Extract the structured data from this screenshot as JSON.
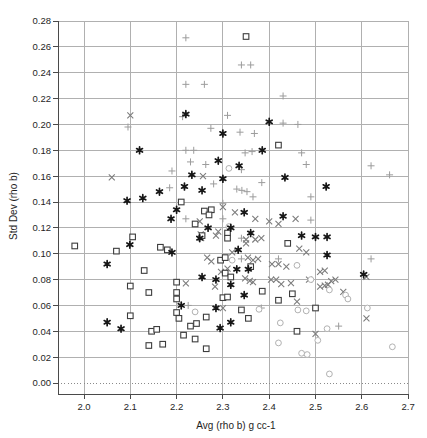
{
  "chart_data": {
    "type": "scatter",
    "title": "",
    "xlabel": "Avg (rho b) g cc-1",
    "ylabel": "Std Dev (rho b)",
    "xlim": [
      1.94,
      2.72
    ],
    "ylim": [
      -0.009,
      0.28
    ],
    "grid": true,
    "zero_line_style": "dotted",
    "legend": "none",
    "x_tick_labels": [
      "2.0",
      "2.1",
      "2.2",
      "2.3",
      "2.4",
      "2.5",
      "2.6",
      "2.7"
    ],
    "y_tick_labels": [
      "0.00",
      "0.02",
      "0.04",
      "0.06",
      "0.08",
      "0.10",
      "0.12",
      "0.14",
      "0.16",
      "0.18",
      "0.20",
      "0.22",
      "0.24",
      "0.26",
      "0.28"
    ],
    "colors": {
      "background": "#ffffff",
      "grid": "#b0b0b0",
      "axis": "#4a4a4a",
      "zero_line": "#8a8a8a"
    },
    "series": [
      {
        "name": "plus-markers",
        "marker": "plus",
        "color": "#9c9c9c",
        "points": [
          [
            2.22,
            0.267
          ],
          [
            2.22,
            0.231
          ],
          [
            2.26,
            0.231
          ],
          [
            2.34,
            0.246
          ],
          [
            2.36,
            0.246
          ],
          [
            2.43,
            0.222
          ],
          [
            2.31,
            0.207
          ],
          [
            2.213,
            0.206
          ],
          [
            2.095,
            0.198
          ],
          [
            2.274,
            0.197
          ],
          [
            2.337,
            0.194
          ],
          [
            2.368,
            0.193
          ],
          [
            2.43,
            0.201
          ],
          [
            2.462,
            0.2
          ],
          [
            2.22,
            0.18
          ],
          [
            2.237,
            0.18
          ],
          [
            2.348,
            0.178
          ],
          [
            2.363,
            0.179
          ],
          [
            2.47,
            0.178
          ],
          [
            2.23,
            0.171
          ],
          [
            2.19,
            0.164
          ],
          [
            2.34,
            0.165
          ],
          [
            2.48,
            0.169
          ],
          [
            2.62,
            0.168
          ],
          [
            2.66,
            0.161
          ],
          [
            2.263,
            0.169
          ],
          [
            2.185,
            0.151
          ],
          [
            2.28,
            0.154
          ],
          [
            2.384,
            0.155
          ],
          [
            2.33,
            0.15
          ],
          [
            2.341,
            0.149
          ],
          [
            2.352,
            0.148
          ],
          [
            2.365,
            0.144
          ],
          [
            2.3,
            0.139
          ],
          [
            2.22,
            0.127
          ],
          [
            2.3,
            0.127
          ],
          [
            2.49,
            0.144
          ],
          [
            2.49,
            0.126
          ],
          [
            2.34,
            0.112
          ],
          [
            2.42,
            0.096
          ],
          [
            2.34,
            0.096
          ],
          [
            2.62,
            0.096
          ],
          [
            2.383,
            0.058
          ],
          [
            2.225,
            0.06
          ],
          [
            2.55,
            0.044
          ]
        ]
      },
      {
        "name": "x-markers",
        "marker": "x",
        "color": "#7d7d7d",
        "points": [
          [
            2.1,
            0.207
          ],
          [
            2.06,
            0.159
          ],
          [
            2.257,
            0.16
          ],
          [
            2.3,
            0.136
          ],
          [
            2.326,
            0.132
          ],
          [
            2.37,
            0.127
          ],
          [
            2.4,
            0.125
          ],
          [
            2.25,
            0.125
          ],
          [
            2.457,
            0.127
          ],
          [
            2.42,
            0.123
          ],
          [
            2.29,
            0.117
          ],
          [
            2.285,
            0.114
          ],
          [
            2.252,
            0.115
          ],
          [
            2.35,
            0.111
          ],
          [
            2.37,
            0.111
          ],
          [
            2.383,
            0.112
          ],
          [
            2.253,
            0.112
          ],
          [
            2.32,
            0.101
          ],
          [
            2.35,
            0.108
          ],
          [
            2.48,
            0.101
          ],
          [
            2.465,
            0.104
          ],
          [
            2.266,
            0.097
          ],
          [
            2.275,
            0.094
          ],
          [
            2.354,
            0.097
          ],
          [
            2.365,
            0.095
          ],
          [
            2.376,
            0.096
          ],
          [
            2.406,
            0.092
          ],
          [
            2.42,
            0.092
          ],
          [
            2.437,
            0.09
          ],
          [
            2.296,
            0.086
          ],
          [
            2.31,
            0.0885
          ],
          [
            2.348,
            0.081
          ],
          [
            2.358,
            0.079
          ],
          [
            2.365,
            0.078
          ],
          [
            2.404,
            0.08
          ],
          [
            2.415,
            0.08
          ],
          [
            2.426,
            0.0765
          ],
          [
            2.447,
            0.0773
          ],
          [
            2.486,
            0.08
          ],
          [
            2.283,
            0.0745
          ],
          [
            2.3,
            0.058
          ],
          [
            2.46,
            0.063
          ],
          [
            2.22,
            0.077
          ],
          [
            2.51,
            0.086
          ],
          [
            2.52,
            0.087
          ],
          [
            2.534,
            0.0788
          ],
          [
            2.543,
            0.08
          ],
          [
            2.51,
            0.0746
          ],
          [
            2.52,
            0.0753
          ],
          [
            2.527,
            0.076
          ],
          [
            2.56,
            0.0705
          ],
          [
            2.61,
            0.082
          ],
          [
            2.61,
            0.05
          ],
          [
            2.5,
            0.038
          ]
        ]
      },
      {
        "name": "open-circle-markers",
        "marker": "circle",
        "color": "#b2b2b2",
        "points": [
          [
            2.313,
            0.166
          ],
          [
            2.313,
            0.121
          ],
          [
            2.32,
            0.095
          ],
          [
            2.46,
            0.091
          ],
          [
            2.49,
            0.08
          ],
          [
            2.53,
            0.072
          ],
          [
            2.565,
            0.068
          ],
          [
            2.57,
            0.065
          ],
          [
            2.612,
            0.058
          ],
          [
            2.378,
            0.057
          ],
          [
            2.462,
            0.0565
          ],
          [
            2.48,
            0.0558
          ],
          [
            2.24,
            0.055
          ],
          [
            2.424,
            0.0465
          ],
          [
            2.525,
            0.042
          ],
          [
            2.505,
            0.033
          ],
          [
            2.42,
            0.031
          ],
          [
            2.666,
            0.028
          ],
          [
            2.47,
            0.023
          ],
          [
            2.482,
            0.022
          ],
          [
            2.53,
            0.007
          ]
        ]
      },
      {
        "name": "open-square-markers",
        "marker": "square",
        "color": "#3d3d3d",
        "points": [
          [
            1.98,
            0.106
          ],
          [
            2.35,
            0.268
          ],
          [
            2.42,
            0.184
          ],
          [
            2.21,
            0.14
          ],
          [
            2.275,
            0.134
          ],
          [
            2.26,
            0.133
          ],
          [
            2.27,
            0.13
          ],
          [
            2.24,
            0.123
          ],
          [
            2.31,
            0.116
          ],
          [
            2.255,
            0.114
          ],
          [
            2.31,
            0.112
          ],
          [
            2.105,
            0.113
          ],
          [
            2.165,
            0.105
          ],
          [
            2.18,
            0.103
          ],
          [
            2.07,
            0.102
          ],
          [
            2.295,
            0.095
          ],
          [
            2.305,
            0.097
          ],
          [
            2.44,
            0.108
          ],
          [
            2.36,
            0.09
          ],
          [
            2.13,
            0.087
          ],
          [
            2.305,
            0.085
          ],
          [
            2.317,
            0.082
          ],
          [
            2.2,
            0.078
          ],
          [
            2.1,
            0.075
          ],
          [
            2.14,
            0.07
          ],
          [
            2.2,
            0.07
          ],
          [
            2.2,
            0.065
          ],
          [
            2.385,
            0.071
          ],
          [
            2.45,
            0.069
          ],
          [
            2.42,
            0.064
          ],
          [
            2.3,
            0.066
          ],
          [
            2.31,
            0.0665
          ],
          [
            2.34,
            0.0565
          ],
          [
            2.5,
            0.058
          ],
          [
            2.355,
            0.05
          ],
          [
            2.264,
            0.051
          ],
          [
            2.2,
            0.0545
          ],
          [
            2.205,
            0.05
          ],
          [
            2.1,
            0.052
          ],
          [
            2.46,
            0.04
          ],
          [
            2.146,
            0.04
          ],
          [
            2.157,
            0.0415
          ],
          [
            2.23,
            0.044
          ],
          [
            2.243,
            0.046
          ],
          [
            2.215,
            0.037
          ],
          [
            2.24,
            0.034
          ],
          [
            2.14,
            0.029
          ],
          [
            2.17,
            0.03
          ],
          [
            2.264,
            0.0265
          ]
        ]
      },
      {
        "name": "filled-star-markers",
        "marker": "star",
        "color": "#161616",
        "points": [
          [
            2.22,
            0.208
          ],
          [
            2.4,
            0.202
          ],
          [
            2.3,
            0.193
          ],
          [
            2.12,
            0.18
          ],
          [
            2.385,
            0.18
          ],
          [
            2.29,
            0.172
          ],
          [
            2.335,
            0.168
          ],
          [
            2.233,
            0.161
          ],
          [
            2.3,
            0.158
          ],
          [
            2.434,
            0.159
          ],
          [
            2.523,
            0.152
          ],
          [
            2.217,
            0.152
          ],
          [
            2.255,
            0.149
          ],
          [
            2.163,
            0.148
          ],
          [
            2.127,
            0.143
          ],
          [
            2.093,
            0.141
          ],
          [
            2.2,
            0.134
          ],
          [
            2.346,
            0.132
          ],
          [
            2.43,
            0.129
          ],
          [
            2.188,
            0.127
          ],
          [
            2.268,
            0.12
          ],
          [
            2.317,
            0.12
          ],
          [
            2.36,
            0.116
          ],
          [
            2.47,
            0.114
          ],
          [
            2.5,
            0.113
          ],
          [
            2.525,
            0.113
          ],
          [
            2.25,
            0.112
          ],
          [
            2.099,
            0.107
          ],
          [
            2.333,
            0.103
          ],
          [
            2.19,
            0.101
          ],
          [
            2.525,
            0.099
          ],
          [
            2.05,
            0.092
          ],
          [
            2.355,
            0.088
          ],
          [
            2.33,
            0.088
          ],
          [
            2.604,
            0.084
          ],
          [
            2.255,
            0.082
          ],
          [
            2.285,
            0.08
          ],
          [
            2.317,
            0.076
          ],
          [
            2.346,
            0.068
          ],
          [
            2.285,
            0.058
          ],
          [
            2.21,
            0.06
          ],
          [
            2.317,
            0.047
          ],
          [
            2.05,
            0.047
          ],
          [
            2.08,
            0.042
          ],
          [
            2.294,
            0.0425
          ]
        ]
      }
    ]
  }
}
